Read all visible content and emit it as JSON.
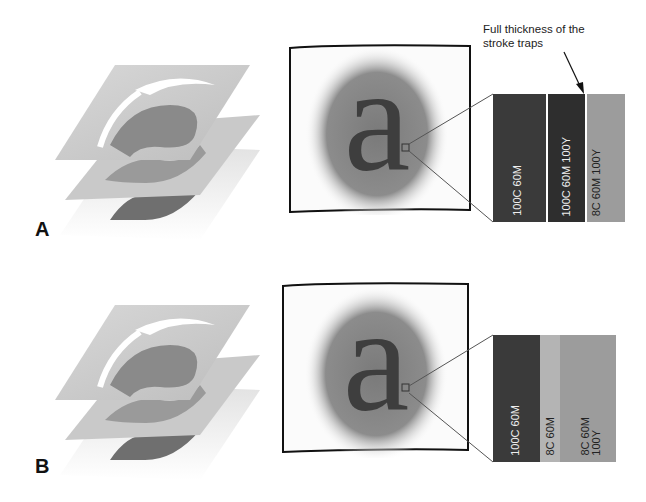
{
  "annotation": {
    "line1": "Full thickness of the",
    "line2": "stroke traps"
  },
  "panels": [
    {
      "label": "A",
      "glyph": "a",
      "swatch": [
        {
          "text": "100C 60M",
          "color": "#3a3a3a",
          "text_color": "#eeeeee"
        },
        {
          "text": "100C 60M 100Y",
          "color": "#2e2e2e",
          "text_color": "#eeeeee"
        },
        {
          "text": "8C 60M 100Y",
          "color": "#9c9c9c",
          "text_color": "#222222"
        }
      ]
    },
    {
      "label": "B",
      "glyph": "a",
      "swatch": [
        {
          "text": "100C 60M",
          "color": "#3a3a3a",
          "text_color": "#eeeeee"
        },
        {
          "text": "8C 60M",
          "color": "#b4b4b4",
          "text_color": "#222222"
        },
        {
          "text_line1": "8C 60M",
          "text_line2": "100Y",
          "color": "#9c9c9c",
          "text_color": "#222222"
        }
      ]
    }
  ]
}
